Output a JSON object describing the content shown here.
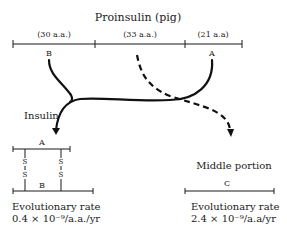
{
  "title": "Proinsulin (pig)",
  "proinsulin": {
    "segments": [
      {
        "label": "(30 a.a.)",
        "chain": "B"
      },
      {
        "label": "(33 a.a.)",
        "chain": ""
      },
      {
        "label": "(21 a.a)",
        "chain": "A"
      }
    ]
  },
  "insulin": {
    "label": "Insulin",
    "chain_a": "A",
    "chain_b": "B",
    "disulfide_s": "S",
    "rate_label": "Evolutionary rate",
    "rate_value": "0.4 × 10⁻⁹/a.a./yr"
  },
  "middle": {
    "label": "Middle portion",
    "chain": "C",
    "rate_label": "Evolutionary rate",
    "rate_value": "2.4 × 10⁻⁹/a.a/yr"
  }
}
